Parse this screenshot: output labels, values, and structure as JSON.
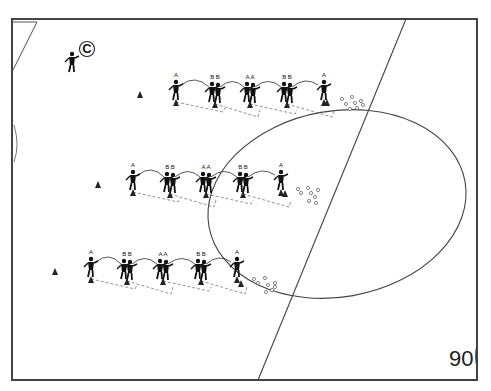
{
  "diagram": {
    "title": "",
    "page_number": "90",
    "colors": {
      "lines": "#444444",
      "figures": "#111111",
      "background": "#ffffff"
    },
    "coach": {
      "label": "C",
      "x": 72,
      "y": 60
    },
    "cones": [
      {
        "x": 140,
        "y": 95
      },
      {
        "x": 98,
        "y": 185
      },
      {
        "x": 55,
        "y": 272
      }
    ],
    "rows": [
      {
        "name": "row-top",
        "players": [
          {
            "label": "A",
            "x": 176,
            "y": 88
          },
          {
            "label": "B B",
            "x": 215,
            "y": 90
          },
          {
            "label": "A A",
            "x": 250,
            "y": 90
          },
          {
            "label": "B B",
            "x": 287,
            "y": 90
          },
          {
            "label": "A",
            "x": 324,
            "y": 88
          }
        ],
        "end_cone": {
          "x": 327,
          "y": 103
        },
        "balls": [
          [
            342,
            99
          ],
          [
            346,
            104
          ],
          [
            352,
            97
          ],
          [
            355,
            103
          ],
          [
            361,
            101
          ],
          [
            357,
            108
          ],
          [
            350,
            109
          ],
          [
            363,
            105
          ]
        ]
      },
      {
        "name": "row-middle",
        "players": [
          {
            "label": "A",
            "x": 133,
            "y": 178
          },
          {
            "label": "B B",
            "x": 170,
            "y": 180
          },
          {
            "label": "A A",
            "x": 206,
            "y": 180
          },
          {
            "label": "B B",
            "x": 243,
            "y": 180
          },
          {
            "label": "A",
            "x": 281,
            "y": 178
          }
        ],
        "end_cone": {
          "x": 285,
          "y": 194
        },
        "balls": [
          [
            298,
            189
          ],
          [
            301,
            193
          ],
          [
            308,
            188
          ],
          [
            311,
            193
          ],
          [
            318,
            190
          ],
          [
            315,
            197
          ],
          [
            309,
            201
          ],
          [
            316,
            203
          ]
        ]
      },
      {
        "name": "row-bottom",
        "players": [
          {
            "label": "A",
            "x": 91,
            "y": 265
          },
          {
            "label": "B B",
            "x": 127,
            "y": 267
          },
          {
            "label": "A A",
            "x": 163,
            "y": 267
          },
          {
            "label": "B B",
            "x": 201,
            "y": 267
          },
          {
            "label": "A",
            "x": 237,
            "y": 265
          }
        ],
        "end_cone": {
          "x": 241,
          "y": 284
        },
        "balls": [
          [
            254,
            279
          ],
          [
            258,
            283
          ],
          [
            265,
            278
          ],
          [
            268,
            285
          ],
          [
            275,
            283
          ],
          [
            272,
            290
          ],
          [
            266,
            292
          ],
          [
            275,
            287
          ]
        ]
      }
    ]
  }
}
